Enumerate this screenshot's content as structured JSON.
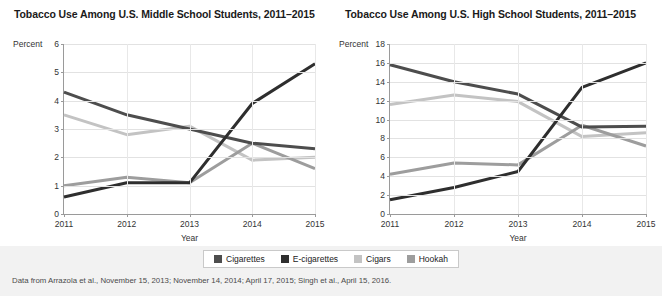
{
  "footnote": "Data from Arrazola et al., November 15, 2013; November 14, 2014; April 17, 2015; Singh et al., April 15, 2016.",
  "legend": {
    "items": [
      {
        "label": "Cigarettes",
        "color": "#4d4d4d"
      },
      {
        "label": "E-cigarettes",
        "color": "#2e2e2e"
      },
      {
        "label": "Cigars",
        "color": "#c3c3c3"
      },
      {
        "label": "Hookah",
        "color": "#9d9d9d"
      }
    ]
  },
  "colors": {
    "cigarettes": "#4d4d4d",
    "ecigarettes": "#2e2e2e",
    "cigars": "#c3c3c3",
    "hookah": "#9d9d9d",
    "grid": "#e2e2e2",
    "axis": "#9a9a9a",
    "panel_background": "#ffffff",
    "page_background": "#f2f2f2"
  },
  "chart_data": [
    {
      "id": "middle-school",
      "type": "line",
      "title": "Tobacco Use Among U.S. Middle School Students, 2011–2015",
      "xlabel": "Year",
      "ylabel": "Percent",
      "categories": [
        "2011",
        "2012",
        "2013",
        "2014",
        "2015"
      ],
      "ylim": [
        0,
        6
      ],
      "yticks": [
        0,
        1,
        2,
        3,
        4,
        5,
        6
      ],
      "grid": true,
      "legend_position": "bottom",
      "series": [
        {
          "name": "Cigarettes",
          "color": "#4d4d4d",
          "values": [
            4.3,
            3.5,
            3.0,
            2.5,
            2.3
          ]
        },
        {
          "name": "E-cigarettes",
          "color": "#2e2e2e",
          "values": [
            0.6,
            1.1,
            1.1,
            3.9,
            5.3
          ]
        },
        {
          "name": "Cigars",
          "color": "#c3c3c3",
          "values": [
            3.5,
            2.8,
            3.1,
            1.9,
            2.0
          ]
        },
        {
          "name": "Hookah",
          "color": "#9d9d9d",
          "values": [
            1.0,
            1.3,
            1.1,
            2.5,
            1.6
          ]
        }
      ]
    },
    {
      "id": "high-school",
      "type": "line",
      "title": "Tobacco Use Among U.S. High School Students, 2011–2015",
      "xlabel": "Year",
      "ylabel": "Percent",
      "categories": [
        "2011",
        "2012",
        "2013",
        "2014",
        "2015"
      ],
      "ylim": [
        0,
        18
      ],
      "yticks": [
        0,
        2,
        4,
        6,
        8,
        10,
        12,
        14,
        16,
        18
      ],
      "grid": true,
      "legend_position": "bottom",
      "series": [
        {
          "name": "Cigarettes",
          "color": "#4d4d4d",
          "values": [
            15.8,
            14.0,
            12.7,
            9.2,
            9.3
          ]
        },
        {
          "name": "E-cigarettes",
          "color": "#2e2e2e",
          "values": [
            1.5,
            2.8,
            4.5,
            13.4,
            16.0
          ]
        },
        {
          "name": "Cigars",
          "color": "#c3c3c3",
          "values": [
            11.6,
            12.6,
            11.9,
            8.2,
            8.6
          ]
        },
        {
          "name": "Hookah",
          "color": "#9d9d9d",
          "values": [
            4.2,
            5.4,
            5.2,
            9.4,
            7.2
          ]
        }
      ]
    }
  ]
}
